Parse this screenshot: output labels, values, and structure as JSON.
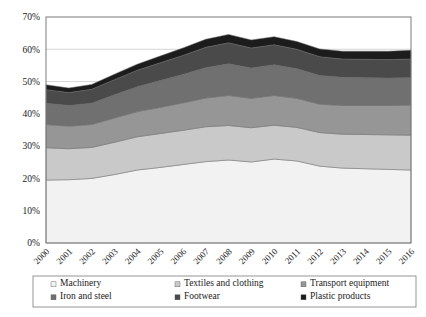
{
  "chart_data": {
    "type": "area",
    "title": "",
    "subtitle": "",
    "xlabel": "",
    "ylabel": "",
    "stacked": true,
    "grid": true,
    "legend_position": "bottom",
    "ylim": [
      0,
      70
    ],
    "ytick_labels": [
      "0%",
      "10%",
      "20%",
      "30%",
      "40%",
      "50%",
      "60%",
      "70%"
    ],
    "ytick_values": [
      0,
      10,
      20,
      30,
      40,
      50,
      60,
      70
    ],
    "categories": [
      "2000",
      "2001",
      "2002",
      "2003",
      "2004",
      "2005",
      "2006",
      "2007",
      "2008",
      "2009",
      "2010",
      "2011",
      "2012",
      "2013",
      "2014",
      "2015",
      "2016"
    ],
    "series": [
      {
        "name": "Machinery",
        "color": "#f2f2f2",
        "values": [
          19.5,
          19.6,
          20.0,
          21.2,
          22.6,
          23.4,
          24.3,
          25.2,
          25.7,
          25.1,
          26.0,
          25.4,
          23.8,
          23.2,
          23.0,
          22.8,
          22.6
        ]
      },
      {
        "name": "Textiles and clothing",
        "color": "#c9c9c9",
        "values": [
          10.0,
          9.6,
          9.6,
          10.0,
          10.3,
          10.5,
          10.6,
          10.8,
          10.7,
          10.6,
          10.5,
          10.4,
          10.4,
          10.5,
          10.6,
          10.7,
          10.8
        ]
      },
      {
        "name": "Transport equipment",
        "color": "#969696",
        "values": [
          7.2,
          7.0,
          7.1,
          7.5,
          7.8,
          8.1,
          8.5,
          8.9,
          9.3,
          9.1,
          9.2,
          9.0,
          8.8,
          8.9,
          9.0,
          9.1,
          9.3
        ]
      },
      {
        "name": "Iron and steel",
        "color": "#707070",
        "values": [
          6.6,
          6.4,
          6.6,
          7.2,
          7.7,
          8.3,
          8.8,
          9.4,
          9.8,
          9.4,
          9.5,
          9.2,
          8.9,
          8.7,
          8.6,
          8.5,
          8.5
        ]
      },
      {
        "name": "Footwear",
        "color": "#4a4a4a",
        "values": [
          4.2,
          4.0,
          4.3,
          4.7,
          5.1,
          5.5,
          5.9,
          6.3,
          6.5,
          6.2,
          6.2,
          6.0,
          5.8,
          5.7,
          5.7,
          5.7,
          5.8
        ]
      },
      {
        "name": "Plastic products",
        "color": "#1c1c1c",
        "values": [
          1.5,
          1.4,
          1.5,
          1.7,
          1.9,
          2.1,
          2.3,
          2.5,
          2.6,
          2.5,
          2.5,
          2.4,
          2.4,
          2.4,
          2.5,
          2.6,
          2.7
        ]
      }
    ],
    "legend_rows": [
      [
        "Machinery",
        "Textiles and clothing",
        "Transport equipment"
      ],
      [
        "Iron and steel",
        "Footwear",
        "Plastic products"
      ]
    ]
  }
}
